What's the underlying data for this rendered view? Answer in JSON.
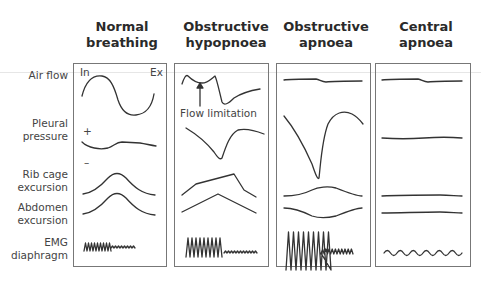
{
  "figure": {
    "columns": [
      {
        "title_line1": "Normal",
        "title_line2": "breathing"
      },
      {
        "title_line1": "Obstructive",
        "title_line2": "hypopnoea"
      },
      {
        "title_line1": "Obstructive",
        "title_line2": "apnoea"
      },
      {
        "title_line1": "Central",
        "title_line2": "apnoea"
      }
    ],
    "rows": [
      {
        "line1": "Air flow",
        "line2": ""
      },
      {
        "line1": "Pleural",
        "line2": "pressure"
      },
      {
        "line1": "Rib cage",
        "line2": "excursion"
      },
      {
        "line1": "Abdomen",
        "line2": "excursion"
      },
      {
        "line1": "EMG",
        "line2": "diaphragm"
      }
    ],
    "annotations": {
      "inspiration": "In",
      "expiration": "Ex",
      "plus": "+",
      "minus": "–",
      "flow_limitation": "Flow limitation"
    },
    "colors": {
      "trace": "#333333",
      "border": "#777777",
      "text": "#444444"
    }
  }
}
